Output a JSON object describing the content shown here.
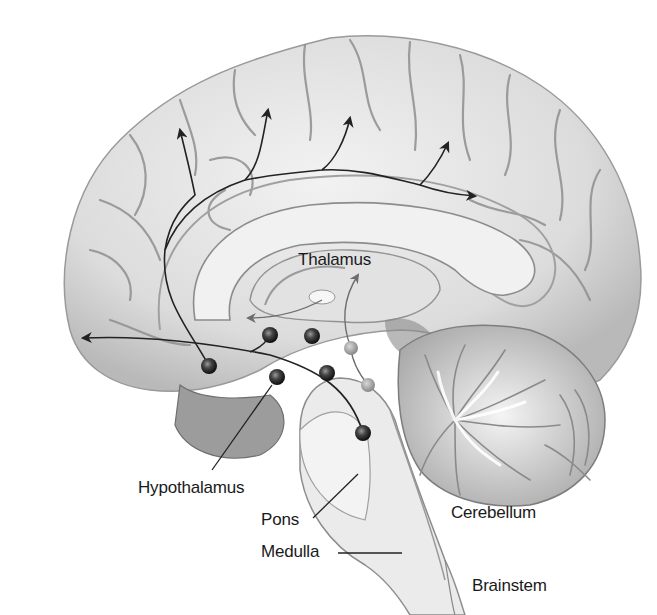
{
  "figure": {
    "colors": {
      "background": "#ffffff",
      "cortex_fill": "#e6e6e6",
      "cortex_shadow": "#b5b5b5",
      "sulcus": "#8a8a8a",
      "brainstem_fill": "#ececec",
      "cerebellum_fill": "#cfcfcf",
      "arrow": "#222222",
      "nucleus_dark": "#2a2a2a",
      "nucleus_light": "#8c8c8c",
      "label_text": "#1a1a1a"
    }
  },
  "labels": {
    "thalamus": "Thalamus",
    "hypothalamus": "Hypothalamus",
    "pons": "Pons",
    "medulla": "Medulla",
    "cerebellum": "Cerebellum",
    "brainstem": "Brainstem"
  },
  "nuclei": {
    "dark": [
      {
        "x": 209,
        "y": 366
      },
      {
        "x": 270,
        "y": 335
      },
      {
        "x": 312,
        "y": 336
      },
      {
        "x": 277,
        "y": 377
      },
      {
        "x": 327,
        "y": 373
      },
      {
        "x": 363,
        "y": 433
      }
    ],
    "light": [
      {
        "x": 351,
        "y": 348
      },
      {
        "x": 368,
        "y": 385
      }
    ]
  }
}
